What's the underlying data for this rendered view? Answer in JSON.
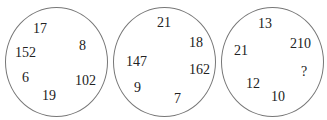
{
  "puzzle": {
    "circles": [
      {
        "numbers": [
          {
            "value": "17",
            "x": 33,
            "y": 22
          },
          {
            "value": "8",
            "x": 79,
            "y": 39
          },
          {
            "value": "152",
            "x": 15,
            "y": 46
          },
          {
            "value": "6",
            "x": 22,
            "y": 71
          },
          {
            "value": "102",
            "x": 75,
            "y": 74
          },
          {
            "value": "19",
            "x": 42,
            "y": 89
          }
        ]
      },
      {
        "numbers": [
          {
            "value": "21",
            "x": 157,
            "y": 16
          },
          {
            "value": "18",
            "x": 189,
            "y": 36
          },
          {
            "value": "147",
            "x": 126,
            "y": 55
          },
          {
            "value": "162",
            "x": 189,
            "y": 63
          },
          {
            "value": "9",
            "x": 134,
            "y": 81
          },
          {
            "value": "7",
            "x": 174,
            "y": 92
          }
        ]
      },
      {
        "numbers": [
          {
            "value": "13",
            "x": 258,
            "y": 17
          },
          {
            "value": "210",
            "x": 290,
            "y": 37
          },
          {
            "value": "21",
            "x": 234,
            "y": 44
          },
          {
            "value": "?",
            "x": 301,
            "y": 65
          },
          {
            "value": "12",
            "x": 246,
            "y": 77
          },
          {
            "value": "10",
            "x": 271,
            "y": 90
          }
        ]
      }
    ]
  }
}
